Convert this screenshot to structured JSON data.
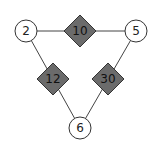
{
  "diagram": {
    "colors": {
      "edge": "#444444",
      "circle_fill": "#ffffff",
      "circle_stroke": "#333333",
      "diamond_fill": "#6b6b6b",
      "diamond_stroke": "#333333"
    },
    "nodes": [
      {
        "id": "top-left",
        "label": "2",
        "cx": 26,
        "cy": 31
      },
      {
        "id": "top-right",
        "label": "5",
        "cx": 136,
        "cy": 31
      },
      {
        "id": "bottom",
        "label": "6",
        "cx": 80,
        "cy": 128
      }
    ],
    "products": [
      {
        "id": "top",
        "label": "10",
        "cx": 80,
        "cy": 31,
        "between": [
          "2",
          "5"
        ]
      },
      {
        "id": "left",
        "label": "12",
        "cx": 53,
        "cy": 79,
        "between": [
          "2",
          "6"
        ]
      },
      {
        "id": "right",
        "label": "30",
        "cx": 108,
        "cy": 79,
        "between": [
          "5",
          "6"
        ]
      }
    ]
  }
}
